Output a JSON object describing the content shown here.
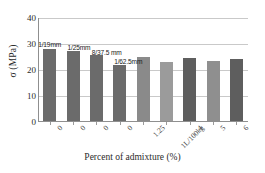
{
  "chart_data": {
    "type": "bar",
    "title": "",
    "xlabel": "Percent of admixture (%)",
    "ylabel": "σ (MPa)",
    "ylim": [
      0,
      40
    ],
    "yticks": [
      0,
      10,
      20,
      30,
      40
    ],
    "ytick_labels": [
      "0",
      "10",
      "20",
      "30",
      "40"
    ],
    "grid": true,
    "legend": "none",
    "categories": [
      "0",
      "0",
      "0",
      "0",
      "1.25",
      "1L/100kg",
      "4",
      "5",
      "6"
    ],
    "values": [
      27.8,
      26.8,
      25.4,
      21.5,
      24.8,
      22.6,
      24.2,
      23.2,
      23.8
    ],
    "bar_colors": [
      "#6b6b6b",
      "#6b6b6b",
      "#6b6b6b",
      "#6b6b6b",
      "#8a8a8a",
      "#9b9b9b",
      "#5e5e5e",
      "#8f8f8f",
      "#5e5e5e"
    ],
    "annotations": [
      {
        "text": "1/19mm",
        "bar_index": 0
      },
      {
        "text": "1/25mm",
        "bar_index": 1
      },
      {
        "text": "8/37.5 mm",
        "bar_index": 2
      },
      {
        "text": "1/62.5mm",
        "bar_index": 3
      }
    ]
  },
  "colors": {
    "gridline": "#c9c9c9",
    "axis": "#8f8f8f",
    "text": "#2b2b2b",
    "background": "#ffffff"
  }
}
